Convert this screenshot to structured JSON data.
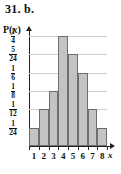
{
  "heading": {
    "number": "31.",
    "part": "b."
  },
  "axis_titles": {
    "y": "P(x)",
    "y_prefix": "P(",
    "y_var": "x",
    "y_suffix": ")",
    "x": "x"
  },
  "colors": {
    "bar_fill": "#c3c3c3",
    "bar_stroke": "#6e6e6e",
    "grid": "#cfcfcf",
    "axis": "#222222",
    "text": "#111111"
  },
  "chart_data": {
    "type": "bar",
    "title": "",
    "xlabel": "x",
    "ylabel": "P(x)",
    "grid": true,
    "legend": "none",
    "categories": [
      "1",
      "2",
      "3",
      "4",
      "5",
      "6",
      "7",
      "8"
    ],
    "values": [
      0.041667,
      0.083333,
      0.125,
      0.25,
      0.208333,
      0.166667,
      0.083333,
      0.041667
    ],
    "value_labels": [
      "1/24",
      "1/12",
      "1/8",
      "1/4",
      "5/24",
      "1/6",
      "1/12",
      "1/24"
    ],
    "ylim": [
      0,
      0.25
    ],
    "ytick_values": [
      0.041667,
      0.083333,
      0.125,
      0.166667,
      0.208333,
      0.25
    ],
    "yticks": [
      {
        "numerator": "1",
        "denominator": "24"
      },
      {
        "numerator": "1",
        "denominator": "12"
      },
      {
        "numerator": "1",
        "denominator": "8"
      },
      {
        "numerator": "1",
        "denominator": "6"
      },
      {
        "numerator": "5",
        "denominator": "24"
      },
      {
        "numerator": "1",
        "denominator": "4"
      }
    ]
  }
}
